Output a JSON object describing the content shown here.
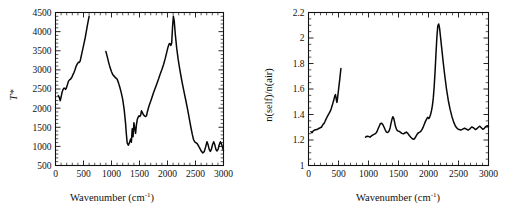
{
  "figure": {
    "background_color": "#ffffff",
    "line_color": "#080808",
    "axis_color": "#111111",
    "panel_count": 2
  },
  "chart_data": [
    {
      "type": "line",
      "panel": "left",
      "title": "",
      "xlabel": "Wavenumber (cm",
      "xlabel_superscript": "-1",
      "xlabel_suffix": ")",
      "ylabel": "T*",
      "ylabel_italic_part": "T",
      "ylabel_star_part": "*",
      "xlim": [
        0,
        3000
      ],
      "ylim": [
        500,
        4500
      ],
      "xticks": [
        0,
        500,
        1000,
        1500,
        2000,
        2500,
        3000
      ],
      "xticklabels": [
        "0",
        "500",
        "1000",
        "1500",
        "2000",
        "2500",
        "3000"
      ],
      "yticks": [
        500,
        1000,
        1500,
        2000,
        2500,
        3000,
        3500,
        4000,
        4500
      ],
      "yticklabels": [
        "500",
        "1000",
        "1500",
        "2000",
        "2500",
        "3000",
        "3500",
        "4000",
        "4500"
      ],
      "x_minor_count": 5,
      "y_minor_count": 5,
      "grid": false,
      "legend": false,
      "series": [
        {
          "name": "segment-low",
          "x": [
            50,
            70,
            85,
            100,
            115,
            130,
            150,
            165,
            180,
            195,
            210,
            230,
            250,
            270,
            290,
            310,
            330,
            350,
            365,
            380,
            395,
            410,
            425,
            440,
            455,
            470,
            490,
            510,
            530,
            550,
            570,
            590,
            600
          ],
          "y": [
            2330,
            2270,
            2195,
            2290,
            2400,
            2470,
            2520,
            2520,
            2490,
            2530,
            2600,
            2700,
            2740,
            2760,
            2800,
            2870,
            2930,
            3010,
            3080,
            3130,
            3170,
            3200,
            3195,
            3230,
            3330,
            3430,
            3560,
            3700,
            3840,
            4000,
            4170,
            4320,
            4400
          ]
        },
        {
          "name": "segment-high",
          "x": [
            900,
            925,
            950,
            975,
            1000,
            1025,
            1050,
            1075,
            1100,
            1125,
            1150,
            1175,
            1200,
            1225,
            1250,
            1265,
            1280,
            1300,
            1320,
            1340,
            1355,
            1370,
            1385,
            1400,
            1415,
            1430,
            1445,
            1460,
            1475,
            1490,
            1505,
            1520,
            1535,
            1550,
            1565,
            1580,
            1595,
            1610,
            1625,
            1640,
            1660,
            1680,
            1700,
            1725,
            1750,
            1780,
            1810,
            1840,
            1870,
            1900,
            1930,
            1960,
            1985,
            2010,
            2030,
            2045,
            2060,
            2075,
            2090,
            2105,
            2120,
            2140,
            2165,
            2190,
            2215,
            2240,
            2270,
            2300,
            2330,
            2360,
            2390,
            2420,
            2445,
            2465,
            2485,
            2505,
            2530,
            2555,
            2580,
            2605,
            2630,
            2655,
            2680,
            2705,
            2725,
            2745,
            2765,
            2785,
            2805,
            2825,
            2845,
            2865,
            2885,
            2905,
            2925,
            2945,
            2965,
            2985,
            3000
          ],
          "y": [
            3480,
            3340,
            3190,
            3060,
            2950,
            2870,
            2830,
            2790,
            2760,
            2660,
            2540,
            2400,
            2230,
            1980,
            1620,
            1330,
            1090,
            1030,
            1090,
            1190,
            1110,
            1460,
            1250,
            1620,
            1480,
            1340,
            1560,
            1700,
            1760,
            1800,
            1780,
            1810,
            1930,
            1890,
            1840,
            1810,
            1790,
            1780,
            1800,
            1900,
            2010,
            2100,
            2180,
            2290,
            2400,
            2520,
            2640,
            2760,
            2890,
            3010,
            3140,
            3300,
            3450,
            3600,
            3680,
            3690,
            3640,
            3700,
            4120,
            4400,
            4280,
            3920,
            3560,
            3280,
            3050,
            2840,
            2610,
            2390,
            2180,
            1960,
            1720,
            1480,
            1300,
            1180,
            1120,
            1100,
            1070,
            1010,
            940,
            870,
            830,
            860,
            980,
            1120,
            1040,
            920,
            870,
            930,
            1050,
            1120,
            1040,
            920,
            880,
            930,
            1050,
            1120,
            1060,
            960,
            890,
            870
          ]
        }
      ]
    },
    {
      "type": "line",
      "panel": "right",
      "title": "",
      "xlabel": "Wavenumber (cm",
      "xlabel_superscript": "-1",
      "xlabel_suffix": ")",
      "ylabel": "n(self)/n(air)",
      "xlim": [
        0,
        3000
      ],
      "ylim": [
        1.0,
        2.2
      ],
      "xticks": [
        0,
        500,
        1000,
        1500,
        2000,
        2500,
        3000
      ],
      "xticklabels": [
        "0",
        "500",
        "1000",
        "1500",
        "2000",
        "2500",
        "3000"
      ],
      "yticks": [
        1,
        1.2,
        1.4,
        1.6,
        1.8,
        2,
        2.2
      ],
      "yticklabels": [
        "1",
        "1.2",
        "1.4",
        "1.6",
        "1.8",
        "2",
        "2.2"
      ],
      "x_minor_count": 5,
      "y_minor_count": 4,
      "grid": false,
      "legend": false,
      "series": [
        {
          "name": "segment-low",
          "x": [
            40,
            60,
            80,
            100,
            120,
            140,
            160,
            180,
            200,
            215,
            230,
            245,
            260,
            275,
            290,
            305,
            320,
            335,
            350,
            365,
            380,
            395,
            410,
            420,
            430,
            440,
            450,
            458,
            466,
            474,
            482,
            492,
            502,
            512,
            522,
            532,
            540
          ],
          "y": [
            1.265,
            1.258,
            1.272,
            1.278,
            1.28,
            1.282,
            1.288,
            1.292,
            1.298,
            1.3,
            1.312,
            1.324,
            1.33,
            1.345,
            1.362,
            1.375,
            1.39,
            1.402,
            1.415,
            1.428,
            1.448,
            1.47,
            1.495,
            1.512,
            1.53,
            1.548,
            1.556,
            1.535,
            1.51,
            1.495,
            1.52,
            1.56,
            1.6,
            1.64,
            1.68,
            1.725,
            1.76
          ]
        },
        {
          "name": "segment-high",
          "x": [
            950,
            975,
            1000,
            1025,
            1050,
            1075,
            1100,
            1120,
            1140,
            1160,
            1180,
            1200,
            1220,
            1240,
            1260,
            1280,
            1300,
            1320,
            1340,
            1360,
            1375,
            1390,
            1405,
            1420,
            1435,
            1450,
            1470,
            1490,
            1510,
            1530,
            1555,
            1580,
            1605,
            1630,
            1655,
            1680,
            1705,
            1730,
            1755,
            1775,
            1795,
            1815,
            1835,
            1855,
            1875,
            1895,
            1915,
            1935,
            1955,
            1975,
            1990,
            2005,
            2020,
            2035,
            2050,
            2065,
            2080,
            2095,
            2110,
            2125,
            2140,
            2155,
            2170,
            2185,
            2200,
            2220,
            2245,
            2270,
            2300,
            2330,
            2360,
            2390,
            2420,
            2450,
            2480,
            2510,
            2540,
            2570,
            2600,
            2630,
            2660,
            2690,
            2720,
            2750,
            2780,
            2805,
            2830,
            2855,
            2880,
            2905,
            2930,
            2955,
            2980,
            3000
          ],
          "y": [
            1.222,
            1.23,
            1.228,
            1.222,
            1.232,
            1.24,
            1.246,
            1.252,
            1.265,
            1.288,
            1.31,
            1.33,
            1.332,
            1.32,
            1.3,
            1.278,
            1.262,
            1.258,
            1.268,
            1.295,
            1.33,
            1.36,
            1.382,
            1.372,
            1.34,
            1.305,
            1.28,
            1.27,
            1.268,
            1.262,
            1.252,
            1.248,
            1.255,
            1.262,
            1.252,
            1.235,
            1.222,
            1.21,
            1.205,
            1.215,
            1.232,
            1.248,
            1.258,
            1.262,
            1.27,
            1.285,
            1.305,
            1.33,
            1.352,
            1.37,
            1.378,
            1.368,
            1.38,
            1.4,
            1.43,
            1.47,
            1.53,
            1.62,
            1.74,
            1.88,
            2.01,
            2.095,
            2.11,
            2.075,
            2.01,
            1.92,
            1.81,
            1.71,
            1.6,
            1.51,
            1.44,
            1.385,
            1.34,
            1.308,
            1.29,
            1.282,
            1.278,
            1.285,
            1.292,
            1.286,
            1.278,
            1.288,
            1.302,
            1.296,
            1.282,
            1.288,
            1.3,
            1.308,
            1.296,
            1.284,
            1.292,
            1.305,
            1.312,
            1.305
          ]
        }
      ]
    }
  ]
}
